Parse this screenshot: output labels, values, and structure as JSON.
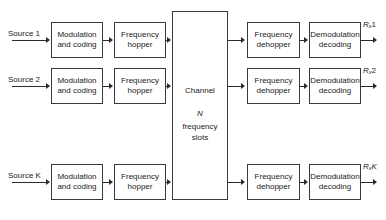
{
  "diagram": {
    "stroke_color": "#3a3a3a",
    "text_color": "#1a1a1a",
    "background": "#ffffff"
  },
  "sources": [
    {
      "label": "Source 1"
    },
    {
      "label": "Source 2"
    },
    {
      "label": "Source K"
    }
  ],
  "tx_modulation": {
    "line1": "Modulation",
    "line2": "and coding"
  },
  "tx_hopper": {
    "line1": "Frequency",
    "line2": "hopper"
  },
  "channel": {
    "line1": "Channel",
    "line2": "N",
    "line3": "frequency",
    "line4": "slots"
  },
  "rx_dehopper": {
    "line1": "Frequency",
    "line2": "dehopper"
  },
  "rx_demodulation": {
    "line1": "Demodulation",
    "line2": "decoding"
  },
  "outputs": [
    {
      "base": "R",
      "sub": "x",
      "index": "1"
    },
    {
      "base": "R",
      "sub": "x",
      "index": "2"
    },
    {
      "base": "R",
      "sub": "x",
      "index": "K"
    }
  ]
}
